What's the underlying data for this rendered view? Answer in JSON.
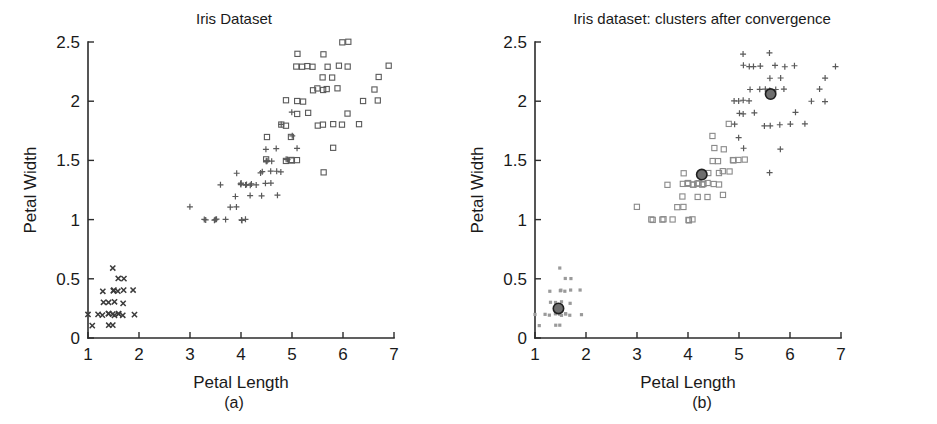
{
  "figure": {
    "background": "#ffffff",
    "marker_colors": {
      "setosa": "#3b3b3b",
      "versicolor": "#5a5a5a",
      "virginica": "#5a5a5a",
      "cluster_light": "#9a9a9a",
      "centroid_fill": "#6e6e6e",
      "centroid_edge": "#1f1f1f"
    }
  },
  "panels": [
    {
      "id": "a",
      "caption": "(a)",
      "title": "Iris Dataset",
      "xlabel": "Petal Length",
      "ylabel": "Petal Width"
    },
    {
      "id": "b",
      "caption": "(b)",
      "title": "Iris dataset: clusters after convergence",
      "xlabel": "Petal Length",
      "ylabel": "Petal Width"
    }
  ],
  "chart_data": [
    {
      "type": "scatter",
      "panel": "a",
      "title": "Iris Dataset",
      "xlabel": "Petal Length",
      "ylabel": "Petal Width",
      "xlim": [
        1,
        7
      ],
      "ylim": [
        0,
        2.5
      ],
      "xticks": [
        1,
        2,
        3,
        4,
        5,
        6,
        7
      ],
      "yticks": [
        0,
        0.5,
        1,
        1.5,
        2,
        2.5
      ],
      "grid": false,
      "legend": "none",
      "series": [
        {
          "name": "setosa",
          "marker": "x",
          "color": "#3b3b3b",
          "points": [
            [
              1.0,
              0.2
            ],
            [
              1.1,
              0.1
            ],
            [
              1.2,
              0.2
            ],
            [
              1.3,
              0.2
            ],
            [
              1.3,
              0.3
            ],
            [
              1.3,
              0.4
            ],
            [
              1.4,
              0.1
            ],
            [
              1.4,
              0.2
            ],
            [
              1.4,
              0.2
            ],
            [
              1.4,
              0.3
            ],
            [
              1.5,
              0.1
            ],
            [
              1.5,
              0.2
            ],
            [
              1.5,
              0.2
            ],
            [
              1.5,
              0.3
            ],
            [
              1.5,
              0.4
            ],
            [
              1.5,
              0.4
            ],
            [
              1.5,
              0.6
            ],
            [
              1.6,
              0.2
            ],
            [
              1.6,
              0.2
            ],
            [
              1.6,
              0.4
            ],
            [
              1.6,
              0.5
            ],
            [
              1.7,
              0.2
            ],
            [
              1.7,
              0.3
            ],
            [
              1.7,
              0.4
            ],
            [
              1.7,
              0.5
            ],
            [
              1.9,
              0.2
            ],
            [
              1.9,
              0.4
            ]
          ]
        },
        {
          "name": "versicolor",
          "marker": "plus",
          "color": "#5a5a5a",
          "points": [
            [
              3.0,
              1.1
            ],
            [
              3.3,
              1.0
            ],
            [
              3.3,
              1.0
            ],
            [
              3.5,
              1.0
            ],
            [
              3.5,
              1.0
            ],
            [
              3.6,
              1.3
            ],
            [
              3.7,
              1.0
            ],
            [
              3.8,
              1.1
            ],
            [
              3.9,
              1.1
            ],
            [
              3.9,
              1.2
            ],
            [
              3.9,
              1.4
            ],
            [
              4.0,
              1.0
            ],
            [
              4.0,
              1.0
            ],
            [
              4.0,
              1.3
            ],
            [
              4.0,
              1.3
            ],
            [
              4.1,
              1.0
            ],
            [
              4.1,
              1.3
            ],
            [
              4.1,
              1.3
            ],
            [
              4.2,
              1.2
            ],
            [
              4.2,
              1.3
            ],
            [
              4.2,
              1.3
            ],
            [
              4.3,
              1.3
            ],
            [
              4.4,
              1.2
            ],
            [
              4.4,
              1.4
            ],
            [
              4.4,
              1.4
            ],
            [
              4.5,
              1.3
            ],
            [
              4.5,
              1.5
            ],
            [
              4.5,
              1.5
            ],
            [
              4.5,
              1.6
            ],
            [
              4.6,
              1.3
            ],
            [
              4.6,
              1.4
            ],
            [
              4.6,
              1.5
            ],
            [
              4.7,
              1.2
            ],
            [
              4.7,
              1.4
            ],
            [
              4.7,
              1.6
            ],
            [
              4.8,
              1.4
            ],
            [
              4.8,
              1.8
            ],
            [
              4.9,
              1.5
            ],
            [
              4.9,
              1.5
            ],
            [
              5.0,
              1.7
            ],
            [
              5.0,
              1.9
            ],
            [
              5.1,
              1.6
            ],
            [
              3.5,
              1.0
            ],
            [
              4.0,
              1.3
            ],
            [
              4.5,
              1.5
            ]
          ]
        },
        {
          "name": "virginica",
          "marker": "square",
          "color": "#5a5a5a",
          "points": [
            [
              4.5,
              1.7
            ],
            [
              4.8,
              1.8
            ],
            [
              4.9,
              1.8
            ],
            [
              4.9,
              2.0
            ],
            [
              5.0,
              1.5
            ],
            [
              5.0,
              1.7
            ],
            [
              5.1,
              1.5
            ],
            [
              5.1,
              1.9
            ],
            [
              5.1,
              2.0
            ],
            [
              5.1,
              2.3
            ],
            [
              5.1,
              2.4
            ],
            [
              5.2,
              2.0
            ],
            [
              5.2,
              2.3
            ],
            [
              5.3,
              1.9
            ],
            [
              5.3,
              2.3
            ],
            [
              5.4,
              2.1
            ],
            [
              5.4,
              2.3
            ],
            [
              5.5,
              1.8
            ],
            [
              5.5,
              2.1
            ],
            [
              5.6,
              1.4
            ],
            [
              5.6,
              1.8
            ],
            [
              5.6,
              2.1
            ],
            [
              5.6,
              2.2
            ],
            [
              5.6,
              2.4
            ],
            [
              5.7,
              2.1
            ],
            [
              5.7,
              2.3
            ],
            [
              5.8,
              1.6
            ],
            [
              5.8,
              1.8
            ],
            [
              5.8,
              2.2
            ],
            [
              5.9,
              2.1
            ],
            [
              5.9,
              2.3
            ],
            [
              6.0,
              1.8
            ],
            [
              6.0,
              2.5
            ],
            [
              6.1,
              1.9
            ],
            [
              6.1,
              2.3
            ],
            [
              6.1,
              2.5
            ],
            [
              6.3,
              1.8
            ],
            [
              6.4,
              2.0
            ],
            [
              6.6,
              2.1
            ],
            [
              6.7,
              2.0
            ],
            [
              6.7,
              2.2
            ],
            [
              6.9,
              2.3
            ],
            [
              4.5,
              1.5
            ],
            [
              4.9,
              1.5
            ],
            [
              5.0,
              1.5
            ]
          ]
        }
      ]
    },
    {
      "type": "scatter",
      "panel": "b",
      "title": "Iris dataset: clusters after convergence",
      "xlabel": "Petal Length",
      "ylabel": "Petal Width",
      "xlim": [
        1,
        7
      ],
      "ylim": [
        0,
        2.5
      ],
      "xticks": [
        1,
        2,
        3,
        4,
        5,
        6,
        7
      ],
      "yticks": [
        0,
        0.5,
        1,
        1.5,
        2,
        2.5
      ],
      "grid": false,
      "legend": "none",
      "series": [
        {
          "name": "cluster-1",
          "marker": "dot",
          "color": "#9a9a9a",
          "points": [
            [
              1.0,
              0.2
            ],
            [
              1.1,
              0.1
            ],
            [
              1.2,
              0.2
            ],
            [
              1.3,
              0.2
            ],
            [
              1.3,
              0.3
            ],
            [
              1.3,
              0.4
            ],
            [
              1.4,
              0.1
            ],
            [
              1.4,
              0.2
            ],
            [
              1.4,
              0.2
            ],
            [
              1.4,
              0.3
            ],
            [
              1.5,
              0.1
            ],
            [
              1.5,
              0.2
            ],
            [
              1.5,
              0.2
            ],
            [
              1.5,
              0.3
            ],
            [
              1.5,
              0.4
            ],
            [
              1.5,
              0.4
            ],
            [
              1.5,
              0.6
            ],
            [
              1.6,
              0.2
            ],
            [
              1.6,
              0.2
            ],
            [
              1.6,
              0.4
            ],
            [
              1.6,
              0.5
            ],
            [
              1.7,
              0.2
            ],
            [
              1.7,
              0.3
            ],
            [
              1.7,
              0.4
            ],
            [
              1.7,
              0.5
            ],
            [
              1.9,
              0.2
            ],
            [
              1.9,
              0.4
            ]
          ]
        },
        {
          "name": "cluster-2",
          "marker": "square",
          "color": "#8a8a8a",
          "points": [
            [
              3.0,
              1.1
            ],
            [
              3.3,
              1.0
            ],
            [
              3.3,
              1.0
            ],
            [
              3.5,
              1.0
            ],
            [
              3.5,
              1.0
            ],
            [
              3.6,
              1.3
            ],
            [
              3.7,
              1.0
            ],
            [
              3.8,
              1.1
            ],
            [
              3.9,
              1.1
            ],
            [
              3.9,
              1.2
            ],
            [
              3.9,
              1.4
            ],
            [
              4.0,
              1.0
            ],
            [
              4.0,
              1.0
            ],
            [
              4.0,
              1.3
            ],
            [
              4.0,
              1.3
            ],
            [
              4.1,
              1.0
            ],
            [
              4.1,
              1.3
            ],
            [
              4.2,
              1.2
            ],
            [
              4.2,
              1.3
            ],
            [
              4.3,
              1.3
            ],
            [
              4.4,
              1.2
            ],
            [
              4.4,
              1.4
            ],
            [
              4.5,
              1.3
            ],
            [
              4.5,
              1.5
            ],
            [
              4.5,
              1.6
            ],
            [
              4.5,
              1.7
            ],
            [
              4.6,
              1.3
            ],
            [
              4.6,
              1.4
            ],
            [
              4.6,
              1.5
            ],
            [
              4.7,
              1.2
            ],
            [
              4.7,
              1.4
            ],
            [
              4.7,
              1.6
            ],
            [
              4.8,
              1.4
            ],
            [
              4.8,
              1.8
            ],
            [
              4.9,
              1.5
            ],
            [
              4.9,
              1.5
            ],
            [
              5.0,
              1.5
            ],
            [
              5.1,
              1.5
            ],
            [
              4.4,
              1.3
            ],
            [
              4.2,
              1.3
            ],
            [
              4.0,
              1.3
            ],
            [
              3.9,
              1.3
            ],
            [
              4.3,
              1.3
            ],
            [
              4.1,
              1.3
            ]
          ]
        },
        {
          "name": "cluster-3",
          "marker": "plus",
          "color": "#5a5a5a",
          "points": [
            [
              5.0,
              1.7
            ],
            [
              5.0,
              1.9
            ],
            [
              5.1,
              1.6
            ],
            [
              5.1,
              1.9
            ],
            [
              5.1,
              2.0
            ],
            [
              5.1,
              2.3
            ],
            [
              5.1,
              2.4
            ],
            [
              5.2,
              2.0
            ],
            [
              5.2,
              2.3
            ],
            [
              5.3,
              1.9
            ],
            [
              5.3,
              2.3
            ],
            [
              5.4,
              2.1
            ],
            [
              5.4,
              2.3
            ],
            [
              5.5,
              1.8
            ],
            [
              5.5,
              2.1
            ],
            [
              5.6,
              1.4
            ],
            [
              5.6,
              1.8
            ],
            [
              5.6,
              2.1
            ],
            [
              5.6,
              2.2
            ],
            [
              5.6,
              2.4
            ],
            [
              5.7,
              2.1
            ],
            [
              5.7,
              2.3
            ],
            [
              5.8,
              1.6
            ],
            [
              5.8,
              1.8
            ],
            [
              5.8,
              2.2
            ],
            [
              5.9,
              2.1
            ],
            [
              5.9,
              2.3
            ],
            [
              6.0,
              1.8
            ],
            [
              6.1,
              1.9
            ],
            [
              6.1,
              2.3
            ],
            [
              6.3,
              1.8
            ],
            [
              6.4,
              2.0
            ],
            [
              6.6,
              2.1
            ],
            [
              6.7,
              2.0
            ],
            [
              6.7,
              2.2
            ],
            [
              6.9,
              2.3
            ],
            [
              4.9,
              2.0
            ],
            [
              4.9,
              1.8
            ],
            [
              5.0,
              2.0
            ],
            [
              5.2,
              2.1
            ]
          ]
        }
      ],
      "centroids": [
        {
          "name": "centroid-1",
          "x": 1.46,
          "y": 0.25
        },
        {
          "name": "centroid-2",
          "x": 4.27,
          "y": 1.38
        },
        {
          "name": "centroid-3",
          "x": 5.62,
          "y": 2.06
        }
      ]
    }
  ]
}
